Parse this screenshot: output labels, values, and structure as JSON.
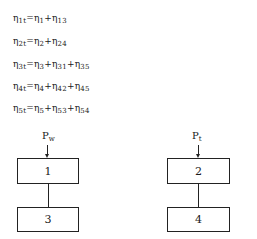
{
  "equations": [
    {
      "lhs_sym": "η",
      "lhs_sub": "1t",
      "terms": [
        {
          "sym": "η",
          "sub": "1"
        },
        {
          "sym": "η",
          "sub": "13"
        }
      ]
    },
    {
      "lhs_sym": "η",
      "lhs_sub": "2t",
      "terms": [
        {
          "sym": "η",
          "sub": "2"
        },
        {
          "sym": "η",
          "sub": "24"
        }
      ]
    },
    {
      "lhs_sym": "η",
      "lhs_sub": "3t",
      "terms": [
        {
          "sym": "η",
          "sub": "3"
        },
        {
          "sym": "η",
          "sub": "31"
        },
        {
          "sym": "η",
          "sub": "35"
        }
      ]
    },
    {
      "lhs_sym": "η",
      "lhs_sub": "4t",
      "terms": [
        {
          "sym": "η",
          "sub": "4"
        },
        {
          "sym": "η",
          "sub": "42"
        },
        {
          "sym": "η",
          "sub": "45"
        }
      ]
    },
    {
      "lhs_sym": "η",
      "lhs_sub": "5t",
      "terms": [
        {
          "sym": "η",
          "sub": "5"
        },
        {
          "sym": "η",
          "sub": "53"
        },
        {
          "sym": "η",
          "sub": "54"
        }
      ]
    }
  ],
  "symbols": {
    "equals": "=",
    "plus": "+"
  },
  "diagram": {
    "left": {
      "input": {
        "sym": "P",
        "sub": "w"
      },
      "top_box": "1",
      "bottom_box": "3"
    },
    "right": {
      "input": {
        "sym": "P",
        "sub": "t"
      },
      "top_box": "2",
      "bottom_box": "4"
    }
  }
}
